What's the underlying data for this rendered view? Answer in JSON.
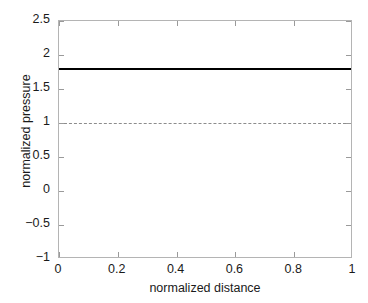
{
  "chart_data": {
    "type": "line",
    "title": "",
    "subtitle": "",
    "xlabel": "normalized distance",
    "ylabel": "normalized pressure",
    "xlim": [
      0,
      1
    ],
    "ylim": [
      -1,
      2.5
    ],
    "xticks": [
      0,
      0.2,
      0.4,
      0.6,
      0.8,
      1
    ],
    "xticklabels": [
      "0",
      "0.2",
      "0.4",
      "0.6",
      "0.8",
      "1"
    ],
    "yticks": [
      -1,
      -0.5,
      0,
      0.5,
      1,
      1.5,
      2,
      2.5
    ],
    "yticklabels": [
      "-1",
      "-0.5",
      "0",
      "0.5",
      "1",
      "1.5",
      "2",
      "2.5"
    ],
    "grid": false,
    "legend": null,
    "background_color": "#ffffff",
    "frame_color": "#b4b4b4",
    "series": [
      {
        "name": "normalized pressure profile",
        "style": "solid",
        "color": "#000000",
        "linewidth": 2,
        "x": [
          0,
          1
        ],
        "values": [
          1.79,
          1.79
        ],
        "constant_value": 1.79
      },
      {
        "name": "reference level",
        "style": "dashed",
        "color": "#8c8c8c",
        "linewidth": 1,
        "x": [
          0,
          1
        ],
        "values": [
          1.0,
          1.0
        ],
        "constant_value": 1.0
      }
    ]
  }
}
